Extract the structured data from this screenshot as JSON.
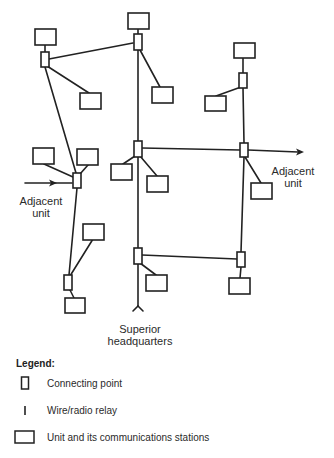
{
  "diagram": {
    "type": "communications network diagram",
    "colors": {
      "stroke": "#222222",
      "background": "#ffffff"
    },
    "labels": {
      "adjacent_unit_left": [
        "Adjacent",
        "unit"
      ],
      "adjacent_unit_right": [
        "Adjacent",
        "unit"
      ],
      "superior_hq": [
        "Superior",
        "headquarters"
      ]
    },
    "connecting_points": [
      {
        "id": "cp-top-left",
        "x": 45,
        "y": 60
      },
      {
        "id": "cp-top-center",
        "x": 138,
        "y": 42
      },
      {
        "id": "cp-top-right",
        "x": 243,
        "y": 80
      },
      {
        "id": "cp-mid-left",
        "x": 77,
        "y": 180
      },
      {
        "id": "cp-mid-center",
        "x": 138,
        "y": 149
      },
      {
        "id": "cp-mid-right",
        "x": 244,
        "y": 150
      },
      {
        "id": "cp-low-left",
        "x": 68,
        "y": 282
      },
      {
        "id": "cp-low-center",
        "x": 138,
        "y": 256
      },
      {
        "id": "cp-low-right",
        "x": 241,
        "y": 259
      }
    ],
    "unit_boxes": 16
  },
  "legend": {
    "title": "Legend:",
    "items": [
      {
        "symbol": "connecting-point",
        "label": "Connecting point"
      },
      {
        "symbol": "wire-radio-relay",
        "label": "Wire/radio relay"
      },
      {
        "symbol": "unit-box",
        "label": "Unit and its communications stations"
      }
    ]
  }
}
